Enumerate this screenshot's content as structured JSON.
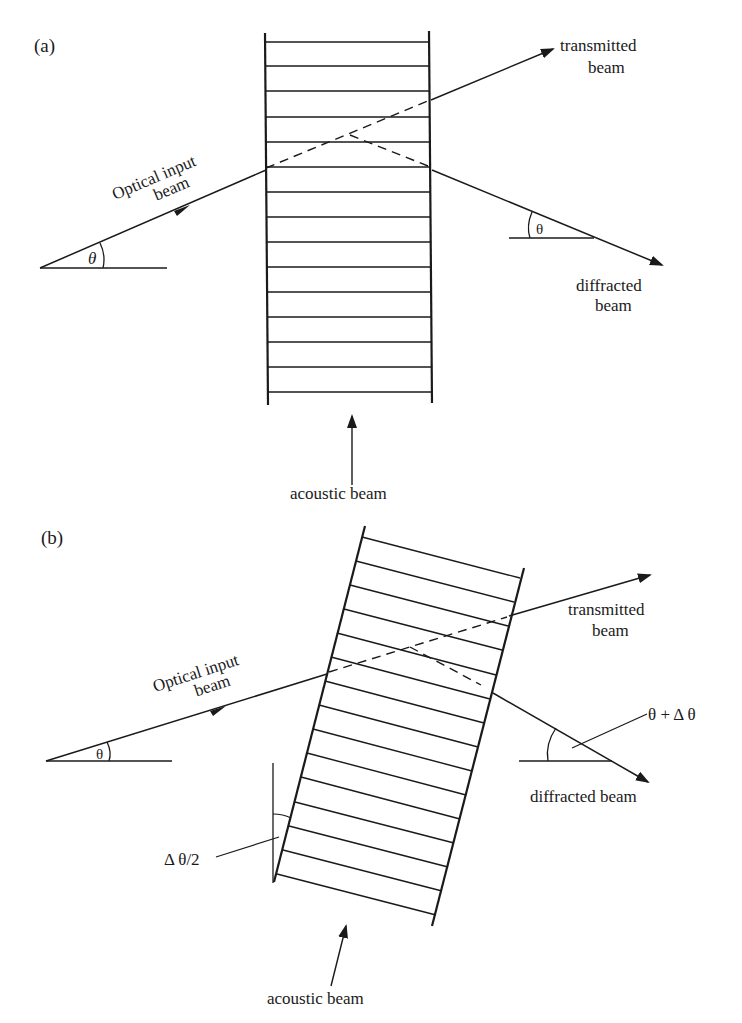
{
  "panel_a": {
    "label": "(a)",
    "input_beam_line1": "Optical input",
    "input_beam_line2": "beam",
    "input_angle": "θ",
    "transmitted_line1": "transmitted",
    "transmitted_line2": "beam",
    "diffracted_angle": "θ",
    "diffracted_line1": "diffracted",
    "diffracted_line2": "beam",
    "acoustic": "acoustic beam"
  },
  "panel_b": {
    "label": "(b)",
    "input_beam_line1": "Optical input",
    "input_beam_line2": "beam",
    "input_angle": "θ",
    "transmitted_line1": "transmitted",
    "transmitted_line2": "beam",
    "diffracted_angle": "θ + Δ θ",
    "diffracted": "diffracted beam",
    "tilt_angle": "Δ θ/2",
    "acoustic": "acoustic beam"
  }
}
